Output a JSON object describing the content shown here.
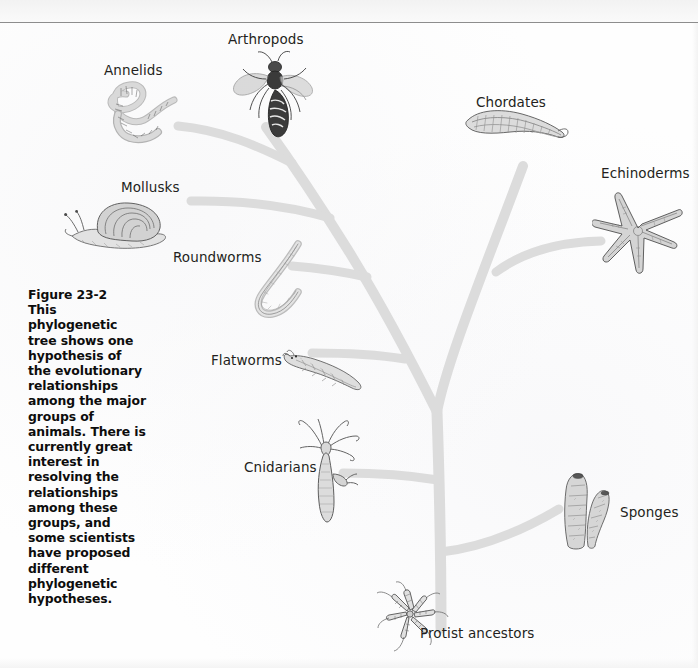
{
  "figure": {
    "number": "Figure 23-2",
    "caption": "This phylogenetic tree shows one hypothesis of the evolutionary relationships among the major groups of animals. There is currently great interest in resolving the relationships among these groups, and some scientists have proposed different phylogenetic hypotheses."
  },
  "tree": {
    "root_label": "Protist ancestors",
    "branch_color": "#dcdcdc",
    "label_color": "#231f20",
    "tips": [
      {
        "id": "annelids",
        "label": "Annelids",
        "label_x": 104,
        "label_y": 62,
        "illustration": "earthworm"
      },
      {
        "id": "arthropods",
        "label": "Arthropods",
        "label_x": 228,
        "label_y": 31,
        "illustration": "wasp"
      },
      {
        "id": "chordates",
        "label": "Chordates",
        "label_x": 476,
        "label_y": 94,
        "illustration": "lancelet"
      },
      {
        "id": "echinoderms",
        "label": "Echinoderms",
        "label_x": 601,
        "label_y": 165,
        "illustration": "sea-star"
      },
      {
        "id": "mollusks",
        "label": "Mollusks",
        "label_x": 121,
        "label_y": 179,
        "illustration": "snail"
      },
      {
        "id": "roundworms",
        "label": "Roundworms",
        "label_x": 173,
        "label_y": 249,
        "illustration": "nematode"
      },
      {
        "id": "flatworms",
        "label": "Flatworms",
        "label_x": 211,
        "label_y": 352,
        "illustration": "planarian"
      },
      {
        "id": "cnidarians",
        "label": "Cnidarians",
        "label_x": 244,
        "label_y": 459,
        "illustration": "hydra"
      },
      {
        "id": "sponges",
        "label": "Sponges",
        "label_x": 620,
        "label_y": 504,
        "illustration": "sponge"
      },
      {
        "id": "protists",
        "label": "Protist ancestors",
        "label_x": 420,
        "label_y": 625,
        "illustration": "choanoflagellate"
      }
    ]
  }
}
